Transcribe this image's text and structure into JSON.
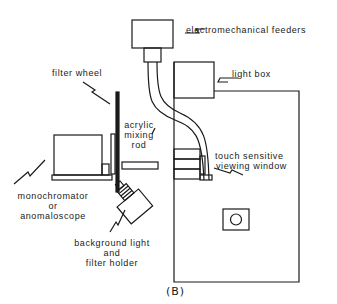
{
  "figure": {
    "caption": "(B)",
    "stroke_color": "#1a1a1a",
    "background": "#ffffff"
  },
  "labels": {
    "electromechanical_feeders": "electromechanical feeders",
    "filter_wheel": "filter wheel",
    "light_box": "light box",
    "acrylic_mixing_rod": [
      "acrylic",
      "mixing",
      "rod"
    ],
    "touch_sensitive_viewing_window": [
      "touch sensitive",
      "viewing window"
    ],
    "monochromator_or_anomaloscope": [
      "monochromator",
      "or",
      "anomaloscope"
    ],
    "background_light_and_filter_holder": [
      "background light",
      "and",
      "filter holder"
    ]
  }
}
